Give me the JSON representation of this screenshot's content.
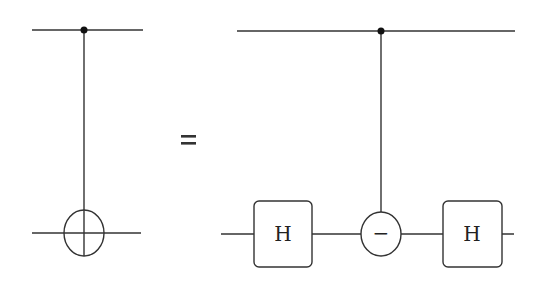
{
  "diagram": {
    "type": "quantum-circuit-identity",
    "equals_symbol": "=",
    "left_circuit": {
      "name": "CNOT",
      "wires": 2,
      "control": {
        "wire": 0,
        "symbol": "dot"
      },
      "target": {
        "wire": 1,
        "symbol": "oplus"
      }
    },
    "right_circuit": {
      "wires": 2,
      "control": {
        "wire": 0,
        "symbol": "dot"
      },
      "gates": [
        {
          "wire": 1,
          "label": "H",
          "shape": "rounded-box"
        },
        {
          "wire": 1,
          "label": "−",
          "shape": "circle",
          "controlled": true
        },
        {
          "wire": 1,
          "label": "H",
          "shape": "rounded-box"
        }
      ]
    },
    "colors": {
      "stroke": "#333333",
      "background": "#ffffff"
    }
  }
}
